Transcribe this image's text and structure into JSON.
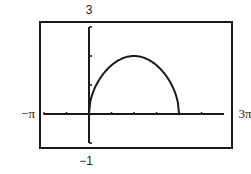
{
  "chart_data": {
    "type": "line",
    "title": "",
    "xlabel": "",
    "ylabel": "",
    "xlim": [
      -3.14159,
      9.42478
    ],
    "ylim": [
      -1,
      3
    ],
    "x_tick_step": 1.5708,
    "y_tick_step": 1,
    "window_labels": {
      "xmin": "−π",
      "xmax": "3π",
      "ymin": "−1",
      "ymax": "3"
    },
    "grid": false,
    "legend": "none",
    "series": [
      {
        "name": "y = 2·sqrt(sin(x/2))",
        "domain": [
          0,
          6.28318
        ],
        "x": [
          0,
          0.3927,
          0.7854,
          1.1781,
          1.5708,
          1.9635,
          2.3562,
          2.7489,
          3.1416,
          3.5343,
          3.927,
          4.3197,
          4.7124,
          5.1051,
          5.4978,
          5.8905,
          6.2832
        ],
        "y": [
          0,
          0.885,
          1.237,
          1.489,
          1.682,
          1.829,
          1.922,
          1.981,
          2.0,
          1.981,
          1.922,
          1.829,
          1.682,
          1.489,
          1.237,
          0.885,
          0
        ]
      }
    ],
    "colors": {
      "line": "#1a1a1a",
      "frame": "#1a1a1a"
    }
  }
}
